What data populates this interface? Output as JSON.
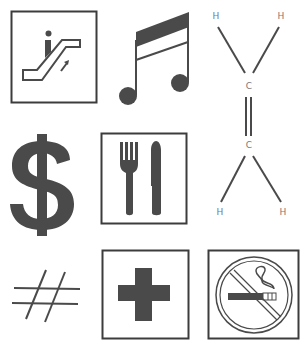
{
  "colors": {
    "background": "#ffffff",
    "ink": "#4a4a4a",
    "frame": "#3c3c3c",
    "label": "#7a7a7a"
  },
  "symbols": [
    {
      "id": "escalator",
      "description": "Escalator sign in square frame"
    },
    {
      "id": "music-note",
      "description": "Beamed sixteenth notes"
    },
    {
      "id": "ethylene",
      "description": "Ethylene structural formula",
      "atoms": {
        "h1": "H",
        "h2": "H",
        "c1": "C",
        "c2": "C",
        "h3": "H",
        "h4": "H"
      }
    },
    {
      "id": "dollar",
      "description": "Dollar sign"
    },
    {
      "id": "restaurant",
      "description": "Fork and knife in square frame"
    },
    {
      "id": "hash",
      "description": "Hash / number sign"
    },
    {
      "id": "first-aid",
      "description": "Cross in square frame"
    },
    {
      "id": "no-smoking",
      "description": "No smoking sign in square frame"
    }
  ]
}
